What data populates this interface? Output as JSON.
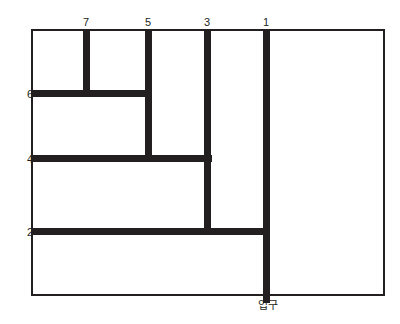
{
  "diagram": {
    "type": "maze-floorplan",
    "title": "",
    "colors": {
      "ink": "#231f20",
      "background": "#ffffff"
    },
    "border": {
      "x": 31,
      "y": 29,
      "width": 354,
      "height": 267,
      "thickness": 2
    },
    "wall_thickness": 7,
    "walls": [
      {
        "id": "wall-1",
        "label": "1",
        "orientation": "vertical",
        "x": 263,
        "y": 29,
        "length": 274,
        "label_position": "top",
        "label_x": 266,
        "label_y": 17
      },
      {
        "id": "wall-3",
        "label": "3",
        "orientation": "vertical",
        "x": 204,
        "y": 29,
        "length": 206,
        "label_position": "top",
        "label_x": 207,
        "label_y": 17
      },
      {
        "id": "wall-5",
        "label": "5",
        "orientation": "vertical",
        "x": 145,
        "y": 29,
        "length": 133,
        "label_position": "top",
        "label_x": 148,
        "label_y": 17
      },
      {
        "id": "wall-7",
        "label": "7",
        "orientation": "vertical",
        "x": 83,
        "y": 29,
        "length": 68,
        "label_position": "top",
        "label_x": 86,
        "label_y": 17
      },
      {
        "id": "wall-6",
        "label": "6",
        "orientation": "horizontal",
        "x": 31,
        "y": 90,
        "length": 121,
        "label_position": "left",
        "label_x": 27,
        "label_y": 94
      },
      {
        "id": "wall-4",
        "label": "4",
        "orientation": "horizontal",
        "x": 31,
        "y": 155,
        "length": 181,
        "label_position": "left",
        "label_x": 27,
        "label_y": 159
      },
      {
        "id": "wall-2",
        "label": "2",
        "orientation": "horizontal",
        "x": 31,
        "y": 228,
        "length": 239,
        "label_position": "left",
        "label_x": 27,
        "label_y": 232
      }
    ],
    "entrance": {
      "text": "입구",
      "x": 268,
      "y": 300
    }
  }
}
